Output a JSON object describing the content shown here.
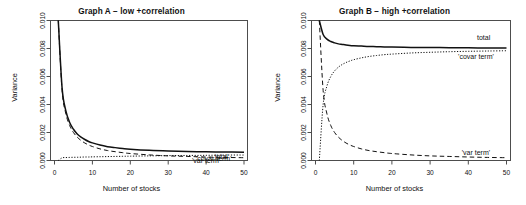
{
  "figure": {
    "panels": [
      {
        "id": "a",
        "title": "Graph A − low +correlation",
        "xlabel": "Number of stocks",
        "ylabel": "Variance"
      },
      {
        "id": "b",
        "title": "Graph B − high +correlation",
        "xlabel": "Number of stocks",
        "ylabel": "Variance"
      }
    ]
  },
  "chart_data": [
    {
      "type": "line",
      "panel": "A",
      "title": "Graph A − low +correlation",
      "xlabel": "Number of stocks",
      "ylabel": "Variance",
      "xlim": [
        0,
        52
      ],
      "ylim": [
        0.0,
        0.01
      ],
      "xticks": [
        0,
        10,
        20,
        30,
        40,
        50
      ],
      "yticks": [
        0.0,
        0.002,
        0.004,
        0.006,
        0.008,
        0.01
      ],
      "xtick_labels": [
        "0",
        "10",
        "20",
        "30",
        "40",
        "50"
      ],
      "ytick_labels": [
        "0.000",
        "0.002",
        "0.004",
        "0.006",
        "0.008",
        "0.010"
      ],
      "grid": false,
      "legend": "inline-annotations",
      "annotations": [
        {
          "text": "total",
          "x": 44,
          "y": 0.00026
        },
        {
          "text": "'covar term'",
          "x": 42,
          "y": 0.0001
        },
        {
          "text": "'var term'",
          "x": 40,
          "y": -4e-05
        }
      ],
      "x": [
        1,
        2,
        3,
        4,
        5,
        6,
        7,
        8,
        9,
        10,
        12,
        14,
        16,
        18,
        20,
        25,
        30,
        35,
        40,
        45,
        50
      ],
      "series": [
        {
          "name": "total",
          "style": "solid",
          "values": [
            0.01,
            0.00519,
            0.00354,
            0.00272,
            0.00223,
            0.0019,
            0.00167,
            0.0015,
            0.00136,
            0.00126,
            0.0011,
            0.00099,
            0.00092,
            0.00086,
            0.00081,
            0.00073,
            0.00068,
            0.00065,
            0.00062,
            0.00061,
            0.00059
          ]
        },
        {
          "name": "'var term'",
          "style": "dashed",
          "values": [
            0.01,
            0.005,
            0.00333,
            0.0025,
            0.002,
            0.00167,
            0.00143,
            0.00125,
            0.00111,
            0.001,
            0.00083,
            0.00071,
            0.00063,
            0.00056,
            0.0005,
            0.0004,
            0.00033,
            0.00029,
            0.00025,
            0.00022,
            0.0002
          ]
        },
        {
          "name": "'covar term'",
          "style": "dotted",
          "values": [
            0.0,
            0.00019,
            0.00021,
            0.00022,
            0.00023,
            0.00023,
            0.00024,
            0.00025,
            0.00025,
            0.00026,
            0.00027,
            0.00028,
            0.00029,
            0.0003,
            0.00031,
            0.00033,
            0.00035,
            0.00036,
            0.00037,
            0.00039,
            0.00039
          ]
        }
      ]
    },
    {
      "type": "line",
      "panel": "B",
      "title": "Graph B − high +correlation",
      "xlabel": "Number of stocks",
      "ylabel": "Variance",
      "xlim": [
        0,
        52
      ],
      "ylim": [
        0.0,
        0.01
      ],
      "xticks": [
        0,
        10,
        20,
        30,
        40,
        50
      ],
      "yticks": [
        0.0,
        0.002,
        0.004,
        0.006,
        0.008,
        0.01
      ],
      "xtick_labels": [
        "0",
        "10",
        "20",
        "30",
        "40",
        "50"
      ],
      "ytick_labels": [
        "0.000",
        "0.002",
        "0.004",
        "0.006",
        "0.008",
        "0.010"
      ],
      "grid": false,
      "legend": "inline-annotations",
      "annotations": [
        {
          "text": "total",
          "x": 44,
          "y": 0.00875
        },
        {
          "text": "'covar term'",
          "x": 42,
          "y": 0.00735
        },
        {
          "text": "'var term'",
          "x": 42,
          "y": 0.00055
        }
      ],
      "x": [
        1,
        2,
        3,
        4,
        5,
        6,
        7,
        8,
        9,
        10,
        12,
        14,
        16,
        18,
        20,
        25,
        30,
        35,
        40,
        45,
        50
      ],
      "series": [
        {
          "name": "total",
          "style": "solid",
          "values": [
            0.01,
            0.009,
            0.00867,
            0.0085,
            0.0084,
            0.00833,
            0.00829,
            0.00825,
            0.00822,
            0.0082,
            0.00817,
            0.00814,
            0.00813,
            0.00811,
            0.0081,
            0.00808,
            0.00807,
            0.00806,
            0.00805,
            0.00804,
            0.00804
          ]
        },
        {
          "name": "'var term'",
          "style": "dashed",
          "values": [
            0.01,
            0.005,
            0.00333,
            0.0025,
            0.002,
            0.00167,
            0.00143,
            0.00125,
            0.00111,
            0.001,
            0.00083,
            0.00071,
            0.00063,
            0.00056,
            0.0005,
            0.0004,
            0.00033,
            0.00029,
            0.00025,
            0.00022,
            0.0002
          ]
        },
        {
          "name": "'covar term'",
          "style": "dotted",
          "values": [
            0.0,
            0.004,
            0.00533,
            0.006,
            0.0064,
            0.00667,
            0.00686,
            0.007,
            0.00711,
            0.0072,
            0.00733,
            0.00743,
            0.0075,
            0.00756,
            0.0076,
            0.00768,
            0.00773,
            0.00777,
            0.0078,
            0.00782,
            0.00784
          ]
        }
      ]
    }
  ],
  "colors": {
    "axis": "#4d4d4d",
    "curve": "#111111",
    "background": "#ffffff"
  }
}
